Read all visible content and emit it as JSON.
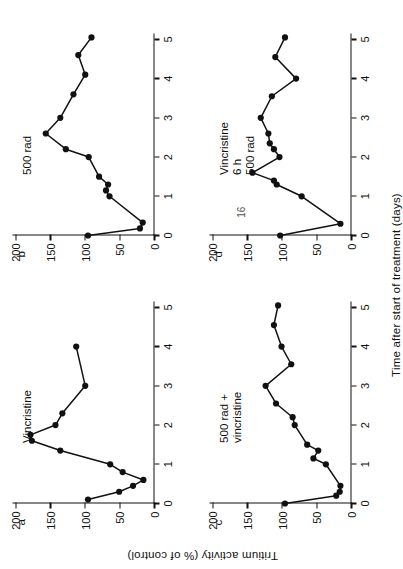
{
  "figure": {
    "y_axis_title": "Tritium activity (% of control)",
    "x_axis_title": "Time after start of treatment (days)",
    "stray_page_number": "16"
  },
  "axes": {
    "x_ticks": [
      "0",
      "1",
      "2",
      "3",
      "4",
      "5"
    ],
    "x_tick_values": [
      0,
      1,
      2,
      3,
      4,
      5
    ],
    "y_ticks": [
      "0",
      "50",
      "100",
      "150",
      "200"
    ],
    "y_tick_values": [
      0,
      50,
      100,
      150,
      200
    ],
    "xlim": [
      0,
      5.15
    ],
    "ylim": [
      0,
      205
    ]
  },
  "chart_data": [
    {
      "type": "line",
      "panel": "a",
      "title": "Vincristine",
      "xlabel": "Time after start of treatment (days)",
      "ylabel": "Tritium activity (% of control)",
      "xlim": [
        0,
        5.15
      ],
      "ylim": [
        0,
        205
      ],
      "grid": false,
      "legend": "none",
      "x": [
        0.1,
        0.3,
        0.45,
        0.6,
        0.8,
        1.0,
        1.35,
        1.6,
        1.75,
        2.0,
        2.3,
        3.0,
        4.0
      ],
      "y": [
        96,
        51,
        31,
        16,
        46,
        64,
        136,
        177,
        179,
        143,
        133,
        100,
        113
      ]
    },
    {
      "type": "line",
      "panel": "b",
      "title": "500 rad",
      "xlabel": "Time after start of treatment (days)",
      "ylabel": "Tritium activity (% of control)",
      "xlim": [
        0,
        5.15
      ],
      "ylim": [
        0,
        205
      ],
      "grid": false,
      "legend": "none",
      "x": [
        0.0,
        0.18,
        0.33,
        1.0,
        1.15,
        1.3,
        1.5,
        2.0,
        2.2,
        2.6,
        3.0,
        3.6,
        4.1,
        4.6,
        5.05
      ],
      "y": [
        96,
        21,
        17,
        65,
        70,
        67,
        80,
        95,
        128,
        157,
        136,
        117,
        100,
        110,
        91
      ]
    },
    {
      "type": "line",
      "panel": "c",
      "title": "500 rad +\nvincristine",
      "xlabel": "Time after start of treatment (days)",
      "ylabel": "Tritium activity (% of control)",
      "xlim": [
        0,
        5.15
      ],
      "ylim": [
        0,
        205
      ],
      "grid": false,
      "legend": "none",
      "x": [
        0.0,
        0.2,
        0.3,
        0.45,
        1.0,
        1.15,
        1.35,
        1.5,
        2.0,
        2.2,
        2.55,
        3.0,
        3.55,
        4.0,
        4.55,
        5.05
      ],
      "y": [
        96,
        22,
        17,
        16,
        37,
        55,
        48,
        64,
        82,
        85,
        109,
        124,
        87,
        101,
        112,
        106
      ]
    },
    {
      "type": "line",
      "panel": "d",
      "title": "Vincristine\n6 h\n500 rad",
      "xlabel": "Time after start of treatment (days)",
      "ylabel": "Tritium activity (% of control)",
      "xlim": [
        0,
        5.15
      ],
      "ylim": [
        0,
        205
      ],
      "grid": false,
      "legend": "none",
      "x": [
        0.0,
        0.3,
        1.0,
        1.3,
        1.4,
        1.6,
        2.0,
        2.2,
        2.35,
        2.6,
        3.0,
        3.55,
        4.0,
        4.55,
        5.05
      ],
      "y": [
        103,
        16,
        72,
        108,
        112,
        143,
        104,
        112,
        118,
        120,
        131,
        115,
        80,
        110,
        96
      ]
    }
  ]
}
